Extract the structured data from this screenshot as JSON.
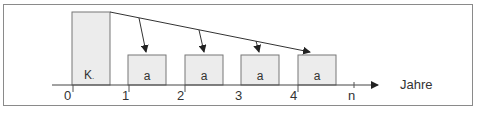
{
  "diagram": {
    "axis_label": "Jahre",
    "ticks": [
      "0",
      "1",
      "2",
      "3",
      "4",
      "n"
    ],
    "capital_label": "K",
    "capital_subscript": ".",
    "annuity_label": "a",
    "annuities": [
      "a",
      "a",
      "a",
      "a"
    ],
    "colors": {
      "box_fill": "#ececec",
      "box_stroke": "#777777",
      "line": "#333333",
      "frame": "#8a8a8a"
    }
  }
}
